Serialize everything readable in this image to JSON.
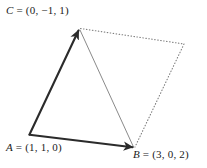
{
  "figure": {
    "type": "vector-triangle-parallelogram",
    "background_color": "#ffffff",
    "width": 207,
    "height": 168,
    "colors": {
      "solid_edge": "#2b2b2b",
      "thin_edge": "#8a8a8a",
      "dotted_edge": "#7d7d7d",
      "label_text": "#1a1a1a"
    },
    "vertices": [
      {
        "id": "A",
        "name": "A",
        "coords": "(1, 1, 0)",
        "x": 29,
        "y": 135
      },
      {
        "id": "B",
        "name": "B",
        "coords": "(3, 0, 2)",
        "x": 134,
        "y": 148
      },
      {
        "id": "C",
        "name": "C",
        "coords": "(0, −1, 1)",
        "x": 79,
        "y": 28
      },
      {
        "id": "D",
        "name": "",
        "coords": "",
        "x": 184,
        "y": 44
      }
    ],
    "edges": [
      {
        "id": "edge-AC",
        "from": "A",
        "to": "C",
        "style": "solid",
        "weight": 2.0,
        "arrowhead": "end"
      },
      {
        "id": "edge-AB",
        "from": "A",
        "to": "B",
        "style": "solid",
        "weight": 2.0,
        "arrowhead": "end"
      },
      {
        "id": "edge-CB",
        "from": "C",
        "to": "B",
        "style": "solid",
        "weight": 0.9,
        "arrowhead": "none"
      },
      {
        "id": "edge-CD",
        "from": "C",
        "to": "D",
        "style": "dotted",
        "weight": 1.0,
        "arrowhead": "none"
      },
      {
        "id": "edge-DB",
        "from": "D",
        "to": "B",
        "style": "dotted",
        "weight": 1.0,
        "arrowhead": "none"
      }
    ],
    "labels": {
      "C": {
        "name": "C",
        "equals": " = ",
        "coords": "(0, −1, 1)"
      },
      "A": {
        "name": "A",
        "equals": " = ",
        "coords": "(1, 1, 0)"
      },
      "B": {
        "name": "B",
        "equals": " = ",
        "coords": "(3, 0, 2)"
      }
    }
  }
}
